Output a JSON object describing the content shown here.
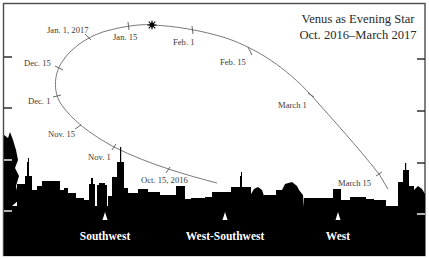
{
  "title": {
    "line1": "Venus as Evening Star",
    "line2": "Oct. 2016–March 2017"
  },
  "path_labels": [
    {
      "text": "Oct. 15, 2016",
      "x": 141,
      "y": 183
    },
    {
      "text": "Nov. 1",
      "x": 88,
      "y": 160
    },
    {
      "text": "Nov. 15",
      "x": 48,
      "y": 138
    },
    {
      "text": "Dec. 1",
      "x": 28,
      "y": 104
    },
    {
      "text": "Dec. 15",
      "x": 24,
      "y": 66
    },
    {
      "text": "Jan. 1, 2017",
      "x": 47,
      "y": 34
    },
    {
      "text": "Jan. 15",
      "x": 113,
      "y": 40
    },
    {
      "text": "Feb. 1",
      "x": 173,
      "y": 45
    },
    {
      "text": "Feb. 15",
      "x": 220,
      "y": 65
    },
    {
      "text": "March 1",
      "x": 279,
      "y": 108
    },
    {
      "text": "March 15",
      "x": 338,
      "y": 187
    }
  ],
  "greatest_brilliance_marker": {
    "symbol": "star",
    "x": 152,
    "y": 25
  },
  "directions": [
    {
      "label": "Southwest",
      "x": 105
    },
    {
      "label": "West-Southwest",
      "x": 225
    },
    {
      "label": "West",
      "x": 338
    }
  ],
  "colors": {
    "path": "#6a6a6a",
    "skyline": "#000000",
    "label_text": "#3a3a3a",
    "direction_text": "#ffffff",
    "border": "#4a4a4a"
  }
}
